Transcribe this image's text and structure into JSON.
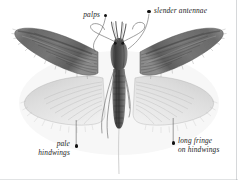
{
  "figure": {
    "background_color": "#ffffff",
    "ink_color": "#1d1d1d",
    "wing_dark_color": "#6d6d6d",
    "wing_pale_color": "#d8d8d8",
    "body_color": "#4a4a4a"
  },
  "annotations": [
    {
      "id": "palps",
      "text": "palps",
      "align": "right",
      "dot": {
        "x": 105,
        "y": 15
      },
      "text_pos": {
        "x": 70,
        "y": 11
      },
      "leader": "M105.6 17.2 C104 26, 100 33, 96 39 C93 43.5, 92.5 48, 95.5 52"
    },
    {
      "id": "slender-antennae",
      "text": "slender antennae",
      "align": "left",
      "dot": {
        "x": 148,
        "y": 11
      },
      "text_pos": {
        "x": 155,
        "y": 7
      },
      "leader": "M149 13.6 C148 22, 146 29, 141 36 C136.5 42.5, 132 46, 128 49"
    },
    {
      "id": "pale-hindwings",
      "text_lines": [
        "pale",
        "hindwings"
      ],
      "align": "right",
      "dot": {
        "x": 75,
        "y": 146
      },
      "text_pos": {
        "x": 28,
        "y": 141
      },
      "leader": "M76.2 145 L76.2 120"
    },
    {
      "id": "long-fringe-on-hindwings",
      "text_lines": [
        "long fringe",
        "on hindwings"
      ],
      "align": "left",
      "dot": {
        "x": 172,
        "y": 143
      },
      "text_pos": {
        "x": 179,
        "y": 138
      },
      "leader": "M173.2 142 L173.2 118"
    }
  ]
}
